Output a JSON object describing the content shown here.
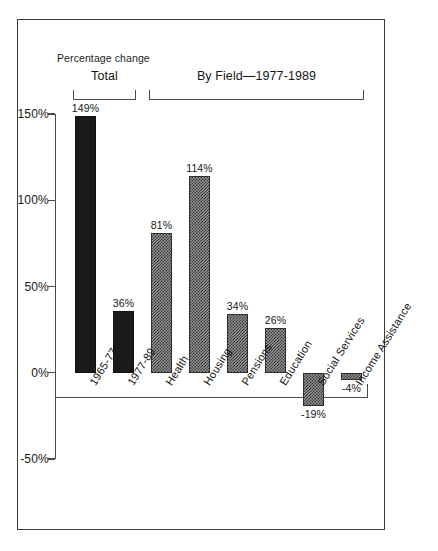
{
  "chart": {
    "axis_title": "Percentage change",
    "groups": [
      {
        "label": "Total",
        "start_index": 0,
        "end_index": 1
      },
      {
        "label": "By Field—1977-1989",
        "start_index": 2,
        "end_index": 7
      }
    ]
  },
  "chart_data": {
    "type": "bar",
    "title": "",
    "subtitle": "",
    "xlabel": "",
    "ylabel": "Percentage change",
    "ylim": [
      -50,
      150
    ],
    "yticks": [
      150,
      100,
      50,
      0,
      -50
    ],
    "ytick_labels": [
      "150%",
      "100%",
      "50%",
      "0%",
      "-50%"
    ],
    "grid": false,
    "legend": "none",
    "categories": [
      "1965-77",
      "1977-89",
      "Health",
      "Housing",
      "Pensions",
      "Education",
      "Social Services",
      "Income Assistance"
    ],
    "values": [
      149,
      36,
      81,
      114,
      34,
      26,
      -19,
      -4
    ],
    "data_labels": [
      "149%",
      "36%",
      "81%",
      "114%",
      "34%",
      "26%",
      "-19%",
      "-4%"
    ],
    "fills": [
      "solid",
      "solid",
      "hatch",
      "hatch",
      "hatch",
      "hatch",
      "hatch",
      "hatch"
    ],
    "colors": {
      "solid": "#1a1a1a",
      "hatch": "#8e8e8e",
      "axis": "#4a4a4a",
      "text": "#141414"
    },
    "groups": [
      {
        "label": "Total",
        "categories": [
          "1965-77",
          "1977-89"
        ]
      },
      {
        "label": "By Field—1977-1989",
        "categories": [
          "Health",
          "Housing",
          "Pensions",
          "Education",
          "Social Services",
          "Income Assistance"
        ]
      }
    ]
  }
}
